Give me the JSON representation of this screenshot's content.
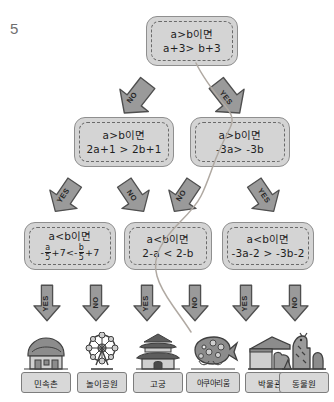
{
  "worksheet": {
    "question_number": "5",
    "top": {
      "id": "root",
      "line1": "a>b이면",
      "line2": "a+3> b+3"
    },
    "level2": [
      {
        "id": "l2-left",
        "line1": "a>b이면",
        "line2": "2a+1 > 2b+1"
      },
      {
        "id": "l2-right",
        "line1": "a>b이면",
        "line2": "-3a> -3b"
      }
    ],
    "level3": [
      {
        "id": "l3-1",
        "line1": "a<b이면",
        "line2_prefix": "-",
        "line2_num1": "a",
        "line2_den1": "5",
        "line2_mid": "+7<-",
        "line2_num2": "b",
        "line2_den2": "5",
        "line2_suffix": "+7"
      },
      {
        "id": "l3-2",
        "line1": "a<b이면",
        "line2": "2-a < 2-b"
      },
      {
        "id": "l3-3",
        "line1": "a<b이면",
        "line2": "-3a-2 > -3b-2"
      }
    ],
    "arrows_level1": [
      {
        "id": "a1-no",
        "label": "NO",
        "direction": "down-left"
      },
      {
        "id": "a1-yes",
        "label": "YES",
        "direction": "down-right"
      }
    ],
    "arrows_level2": [
      {
        "id": "a2-1",
        "label": "YES",
        "direction": "down-left"
      },
      {
        "id": "a2-2",
        "label": "NO",
        "direction": "down-right"
      },
      {
        "id": "a2-3",
        "label": "NO",
        "direction": "down-left"
      },
      {
        "id": "a2-4",
        "label": "YES",
        "direction": "down-right"
      }
    ],
    "arrows_level3": [
      {
        "id": "a3-1",
        "label": "YES",
        "direction": "down"
      },
      {
        "id": "a3-2",
        "label": "NO",
        "direction": "down"
      },
      {
        "id": "a3-3",
        "label": "YES",
        "direction": "down"
      },
      {
        "id": "a3-4",
        "label": "NO",
        "direction": "down"
      },
      {
        "id": "a3-5",
        "label": "YES",
        "direction": "down"
      },
      {
        "id": "a3-6",
        "label": "NO",
        "direction": "down"
      }
    ],
    "destinations": [
      {
        "id": "dest-1",
        "label": "민속촌",
        "icon": "folk-village-icon"
      },
      {
        "id": "dest-2",
        "label": "놀이공원",
        "icon": "ferris-wheel-icon"
      },
      {
        "id": "dest-3",
        "label": "고궁",
        "icon": "palace-gate-icon"
      },
      {
        "id": "dest-4",
        "label": "아쿠아리움",
        "icon": "aquarium-fish-icon"
      },
      {
        "id": "dest-5",
        "label": "박물관",
        "icon": "museum-icon"
      },
      {
        "id": "dest-6",
        "label": "동물원",
        "icon": "giraffe-zoo-icon"
      }
    ],
    "answer_trace": {
      "id": "answer-path",
      "description": "hand-drawn pencil line from top box through YES then NO then NO ending at 아쿠아리움"
    },
    "colors": {
      "box_fill": "#d4d4d4",
      "box_border": "#8f8f8f",
      "arrow_fill": "#9a9a9a",
      "arrow_border": "#4f4f4f",
      "text": "#1e1e1e",
      "qnum": "#6f6f6f",
      "trace": "#b0a9a2"
    }
  }
}
